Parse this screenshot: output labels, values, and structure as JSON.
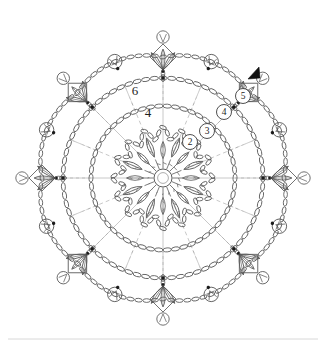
{
  "document": {
    "type": "crochet-doily-chart",
    "title": "Crochet doily round motif chart",
    "background_color": "#ffffff",
    "line_color": "#5a5a5a",
    "label_color": "#1d1d1d",
    "marker_color": "#111111",
    "width": 326,
    "height": 351
  },
  "chart_data": {
    "type": "diagram",
    "title": "",
    "center": {
      "x": 163,
      "y": 178
    },
    "round_labels_plain": [
      {
        "text": "6",
        "x": 135,
        "y": 95
      },
      {
        "text": "4",
        "x": 148,
        "y": 117
      }
    ],
    "round_labels_circled": [
      {
        "text": "2",
        "cx": 190,
        "cy": 142,
        "r": 7.5
      },
      {
        "text": "3",
        "cx": 207,
        "cy": 131,
        "r": 7.5
      },
      {
        "text": "4",
        "cx": 224,
        "cy": 112,
        "r": 7.5
      },
      {
        "text": "5",
        "cx": 243,
        "cy": 96,
        "r": 7.5
      }
    ],
    "start_marker": {
      "name": "start-arrowhead",
      "x": 250,
      "y": 75,
      "direction": "down-left",
      "color": "#111111"
    },
    "rings": [
      {
        "name": "center-ring",
        "r": 9,
        "label": "1"
      },
      {
        "name": "inner-petal-round",
        "r": 46,
        "label": "2"
      },
      {
        "name": "mid-chain-ring",
        "r": 72,
        "label": "4"
      },
      {
        "name": "outer-chain-ring",
        "r": 100,
        "label": "6"
      }
    ],
    "spokes": 16,
    "outer_motifs": {
      "count": 8,
      "type": "leaf-cluster-diamond"
    },
    "outer_picots": {
      "count": 8,
      "type": "picot-loop"
    },
    "petals_inner": 8,
    "petals_outer_inner_round": 8
  },
  "footer": {
    "rule_visible": true
  }
}
